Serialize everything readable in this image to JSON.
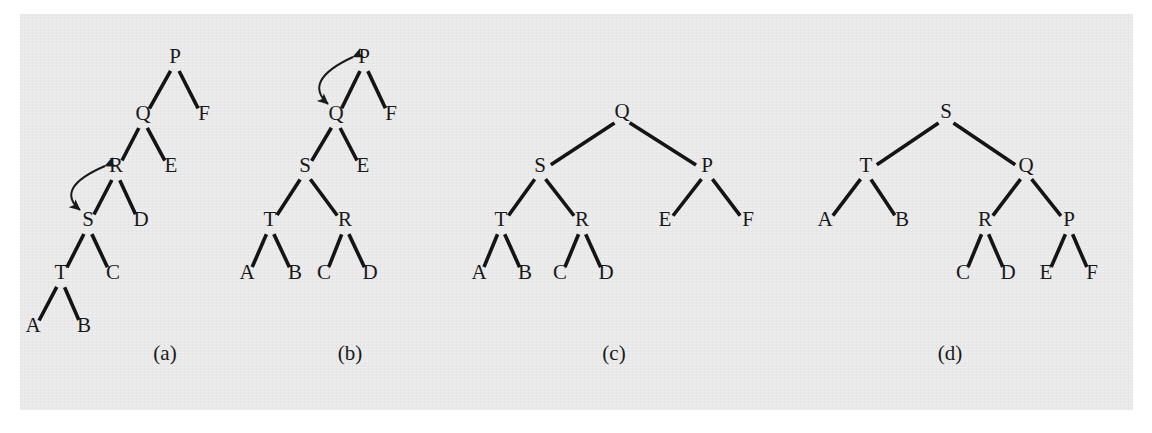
{
  "figure": {
    "background_color": "#e9e9e9",
    "page_color": "#ffffff",
    "ink_color": "#141416",
    "panels": [
      {
        "id": "panel-a",
        "caption": "(a)",
        "caption_x": 165,
        "caption_y": 360,
        "origin_x": 0,
        "origin_y": 0,
        "nodes": [
          {
            "label": "P",
            "x": 175,
            "y": 63
          },
          {
            "label": "Q",
            "x": 143,
            "y": 120
          },
          {
            "label": "F",
            "x": 204,
            "y": 120
          },
          {
            "label": "R",
            "x": 116,
            "y": 172
          },
          {
            "label": "E",
            "x": 171,
            "y": 172
          },
          {
            "label": "S",
            "x": 88,
            "y": 226
          },
          {
            "label": "D",
            "x": 141,
            "y": 226
          },
          {
            "label": "T",
            "x": 61,
            "y": 279
          },
          {
            "label": "C",
            "x": 113,
            "y": 279
          },
          {
            "label": "A",
            "x": 33,
            "y": 332
          },
          {
            "label": "B",
            "x": 84,
            "y": 332
          }
        ],
        "edges": [
          {
            "from": "P",
            "to": "Q"
          },
          {
            "from": "P",
            "to": "F"
          },
          {
            "from": "Q",
            "to": "R"
          },
          {
            "from": "Q",
            "to": "E"
          },
          {
            "from": "R",
            "to": "S"
          },
          {
            "from": "R",
            "to": "D"
          },
          {
            "from": "S",
            "to": "T"
          },
          {
            "from": "S",
            "to": "C"
          },
          {
            "from": "T",
            "to": "A"
          },
          {
            "from": "T",
            "to": "B"
          }
        ],
        "rotation_arrow": {
          "from": "R",
          "to": "S",
          "type": "double-headed-arc",
          "side": "left"
        }
      },
      {
        "id": "panel-b",
        "caption": "(b)",
        "caption_x": 350,
        "caption_y": 360,
        "origin_x": 0,
        "origin_y": 0,
        "nodes": [
          {
            "label": "P",
            "x": 364,
            "y": 63
          },
          {
            "label": "Q",
            "x": 336,
            "y": 120
          },
          {
            "label": "F",
            "x": 391,
            "y": 120
          },
          {
            "label": "S",
            "x": 305,
            "y": 172
          },
          {
            "label": "E",
            "x": 363,
            "y": 172
          },
          {
            "label": "T",
            "x": 270,
            "y": 226
          },
          {
            "label": "R",
            "x": 345,
            "y": 226
          },
          {
            "label": "A",
            "x": 247,
            "y": 279
          },
          {
            "label": "B",
            "x": 295,
            "y": 279
          },
          {
            "label": "C",
            "x": 324,
            "y": 279
          },
          {
            "label": "D",
            "x": 370,
            "y": 279
          }
        ],
        "edges": [
          {
            "from": "P",
            "to": "Q"
          },
          {
            "from": "P",
            "to": "F"
          },
          {
            "from": "Q",
            "to": "S"
          },
          {
            "from": "Q",
            "to": "E"
          },
          {
            "from": "S",
            "to": "T"
          },
          {
            "from": "S",
            "to": "R"
          },
          {
            "from": "T",
            "to": "A"
          },
          {
            "from": "T",
            "to": "B"
          },
          {
            "from": "R",
            "to": "C"
          },
          {
            "from": "R",
            "to": "D"
          }
        ],
        "rotation_arrow": {
          "from": "P",
          "to": "Q",
          "type": "double-headed-arc",
          "side": "left"
        }
      },
      {
        "id": "panel-c",
        "caption": "(c)",
        "caption_x": 614,
        "caption_y": 360,
        "origin_x": 0,
        "origin_y": 0,
        "nodes": [
          {
            "label": "Q",
            "x": 622,
            "y": 118
          },
          {
            "label": "S",
            "x": 540,
            "y": 172
          },
          {
            "label": "P",
            "x": 707,
            "y": 172
          },
          {
            "label": "T",
            "x": 501,
            "y": 226
          },
          {
            "label": "R",
            "x": 582,
            "y": 226
          },
          {
            "label": "E",
            "x": 665,
            "y": 226
          },
          {
            "label": "F",
            "x": 748,
            "y": 226
          },
          {
            "label": "A",
            "x": 479,
            "y": 279
          },
          {
            "label": "B",
            "x": 525,
            "y": 279
          },
          {
            "label": "C",
            "x": 560,
            "y": 279
          },
          {
            "label": "D",
            "x": 606,
            "y": 279
          }
        ],
        "edges": [
          {
            "from": "Q",
            "to": "S"
          },
          {
            "from": "Q",
            "to": "P"
          },
          {
            "from": "S",
            "to": "T"
          },
          {
            "from": "S",
            "to": "R"
          },
          {
            "from": "P",
            "to": "E"
          },
          {
            "from": "P",
            "to": "F"
          },
          {
            "from": "T",
            "to": "A"
          },
          {
            "from": "T",
            "to": "B"
          },
          {
            "from": "R",
            "to": "C"
          },
          {
            "from": "R",
            "to": "D"
          }
        ],
        "rotation_arrow": null
      },
      {
        "id": "panel-d",
        "caption": "(d)",
        "caption_x": 950,
        "caption_y": 360,
        "origin_x": 0,
        "origin_y": 0,
        "nodes": [
          {
            "label": "S",
            "x": 946,
            "y": 118
          },
          {
            "label": "T",
            "x": 866,
            "y": 172
          },
          {
            "label": "Q",
            "x": 1026,
            "y": 172
          },
          {
            "label": "A",
            "x": 825,
            "y": 226
          },
          {
            "label": "B",
            "x": 902,
            "y": 226
          },
          {
            "label": "R",
            "x": 985,
            "y": 226
          },
          {
            "label": "P",
            "x": 1069,
            "y": 226
          },
          {
            "label": "C",
            "x": 963,
            "y": 279
          },
          {
            "label": "D",
            "x": 1008,
            "y": 279
          },
          {
            "label": "E",
            "x": 1046,
            "y": 279
          },
          {
            "label": "F",
            "x": 1092,
            "y": 279
          }
        ],
        "edges": [
          {
            "from": "S",
            "to": "T"
          },
          {
            "from": "S",
            "to": "Q"
          },
          {
            "from": "T",
            "to": "A"
          },
          {
            "from": "T",
            "to": "B"
          },
          {
            "from": "Q",
            "to": "R"
          },
          {
            "from": "Q",
            "to": "P"
          },
          {
            "from": "R",
            "to": "C"
          },
          {
            "from": "R",
            "to": "D"
          },
          {
            "from": "P",
            "to": "E"
          },
          {
            "from": "P",
            "to": "F"
          }
        ],
        "rotation_arrow": null
      }
    ]
  }
}
